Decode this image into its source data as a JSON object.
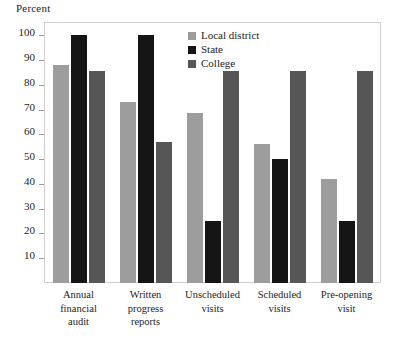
{
  "chart_data": {
    "type": "bar",
    "title": "",
    "subtitle": "",
    "xlabel": "",
    "ylabel": "Percent",
    "ylim": [
      0,
      105
    ],
    "yticks": [
      10,
      20,
      30,
      40,
      50,
      60,
      70,
      80,
      90,
      100
    ],
    "grid": false,
    "legend_position": "top-center",
    "categories": [
      "Annual financial audit",
      "Written progress reports",
      "Unscheduled visits",
      "Scheduled visits",
      "Pre-opening visit"
    ],
    "category_lines": [
      [
        "Annual",
        "financial",
        "audit"
      ],
      [
        "Written",
        "progress",
        "reports"
      ],
      [
        "Unscheduled",
        "visits"
      ],
      [
        "Scheduled",
        "visits"
      ],
      [
        "Pre-opening",
        "visit"
      ]
    ],
    "series": [
      {
        "name": "Local district",
        "color": "#9d9d9d",
        "values": [
          88,
          73,
          68.5,
          56,
          42
        ]
      },
      {
        "name": "State",
        "color": "#151515",
        "values": [
          100,
          100,
          25,
          50,
          25
        ]
      },
      {
        "name": "College",
        "color": "#565656",
        "values": [
          85.5,
          57,
          85.5,
          85.5,
          85.5
        ]
      }
    ]
  }
}
